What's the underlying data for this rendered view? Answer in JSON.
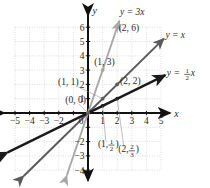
{
  "chart_data": {
    "type": "line",
    "title": "",
    "xlabel": "x",
    "ylabel": "y",
    "xlim": [
      -5.8,
      5.8
    ],
    "ylim": [
      -4.8,
      6.8
    ],
    "grid": true,
    "grid_style": "dotted",
    "legend": "inline-line-labels",
    "xticks": [
      -5,
      -4,
      -3,
      -2,
      0,
      1,
      2,
      3,
      4,
      5
    ],
    "xtick_labels": [
      "−5",
      "−4",
      "−3",
      "−2",
      "0",
      "1",
      "2",
      "3",
      "4",
      "5"
    ],
    "yticks": [
      6,
      5,
      4,
      3,
      2,
      1,
      -2,
      -3,
      -4
    ],
    "ytick_labels": [
      "6",
      "5",
      "4",
      "3",
      "2",
      "1",
      "−2",
      "−3",
      "−4"
    ],
    "series": [
      {
        "name": "y = 3x",
        "label": "y = 3x",
        "slope": 3,
        "color": "#a8a8a8",
        "x": [
          -1.45,
          2.15
        ],
        "y": [
          -4.35,
          6.45
        ],
        "points": [
          {
            "x": 0,
            "y": 0,
            "label": "(0, 0)"
          },
          {
            "x": 1,
            "y": 3,
            "label": "(1, 3)"
          },
          {
            "x": 2,
            "y": 6,
            "label": "(2, 6)"
          }
        ]
      },
      {
        "name": "y = x",
        "label": "y = x",
        "slope": 1,
        "color": "#5a5a5a",
        "x": [
          -4.4,
          5.2
        ],
        "y": [
          -4.4,
          5.2
        ],
        "points": [
          {
            "x": 0,
            "y": 0,
            "label": "(0, 0)"
          },
          {
            "x": 1,
            "y": 1,
            "label": "(1, 1)"
          },
          {
            "x": 2,
            "y": 2,
            "label": "(2, 2)"
          }
        ]
      },
      {
        "name": "y = 1/2 x",
        "label": "y = ½x",
        "label_num": "1",
        "label_den": "2",
        "slope": 0.5,
        "color": "#1a1a1a",
        "x": [
          -5.5,
          5.3
        ],
        "y": [
          -2.75,
          2.65
        ],
        "points": [
          {
            "x": 1,
            "y": 0.5,
            "label": "(1, ½)"
          },
          {
            "x": 2,
            "y": 1,
            "label": "(2, ⅔)"
          }
        ]
      }
    ],
    "annotations": [
      {
        "id": "pt-0-0",
        "text": "(0, 0)",
        "x": -1.55,
        "y": 0.72
      },
      {
        "id": "pt-1-1",
        "text": "(1, 1)",
        "x": -2.05,
        "y": 1.95
      },
      {
        "id": "pt-1-3",
        "text": "(1, 3)",
        "x": 0.42,
        "y": 3.35
      },
      {
        "id": "pt-2-6",
        "text": "(2, 6)",
        "x": 2.1,
        "y": 5.7
      },
      {
        "id": "pt-2-2",
        "text": "(2, 2)",
        "x": 2.2,
        "y": 2.05
      },
      {
        "id": "pt-1-half",
        "num": "1",
        "den": "2",
        "prefix": "(1, ",
        "suffix": ")",
        "x": 0.68,
        "y": -2.35
      },
      {
        "id": "pt-2-twothirds",
        "num": "2",
        "den": "3",
        "prefix": "(2, ",
        "suffix": ")",
        "x": 2.08,
        "y": -2.75
      }
    ],
    "axis_labels": {
      "x": "x",
      "y": "y"
    },
    "line_labels": [
      {
        "id": "label-y-3x",
        "text": "y = 3x",
        "x": 2.2,
        "y": 6.85
      },
      {
        "id": "label-y-x",
        "text": "y = x",
        "x": 5.3,
        "y": 5.25
      },
      {
        "id": "label-y-half-x",
        "prefix": "y = ",
        "num": "1",
        "den": "2",
        "suffix": "x",
        "x": 5.4,
        "y": 2.6
      }
    ],
    "colors": {
      "grid": "#cfcfcf",
      "axis": "#111111",
      "line_3x": "#a8a8a8",
      "line_x": "#5a5a5a",
      "line_half_x": "#1a1a1a",
      "text": "#2b2b2b",
      "background": "#ffffff"
    }
  }
}
